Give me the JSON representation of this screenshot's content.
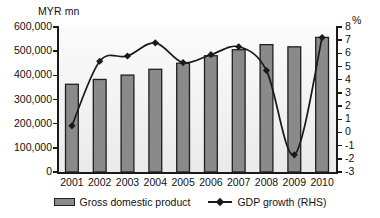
{
  "chart_data": {
    "type": "bar",
    "title": "",
    "xlabel": "",
    "ylabel": "MYR mn",
    "y2label": "%",
    "categories": [
      "2001",
      "2002",
      "2003",
      "2004",
      "2005",
      "2006",
      "2007",
      "2008",
      "2009",
      "2010"
    ],
    "ylim": [
      0,
      600000
    ],
    "y2lim": [
      -3,
      8
    ],
    "yticks": [
      0,
      100000,
      200000,
      300000,
      400000,
      500000,
      600000
    ],
    "ytick_labels": [
      "0",
      "100,000",
      "200,000",
      "300,000",
      "400,000",
      "500,000",
      "600,000"
    ],
    "y2ticks": [
      -3,
      -2,
      -1,
      0,
      1,
      2,
      3,
      4,
      5,
      6,
      7,
      8
    ],
    "y2tick_labels": [
      "-3",
      "-2",
      "-1",
      "0",
      "1",
      "2",
      "3",
      "4",
      "5",
      "6",
      "7",
      "8"
    ],
    "grid": false,
    "legend_position": "bottom",
    "series": [
      {
        "name": "Gross domestic product",
        "type": "bar",
        "axis": "left",
        "unit": "MYR mn",
        "color": "#8a8a8a",
        "edge_color": "#1f1f1f",
        "values": [
          363000,
          383000,
          401000,
          425000,
          450000,
          481000,
          506000,
          527000,
          518000,
          557000
        ]
      },
      {
        "name": "GDP growth (RHS)",
        "type": "line",
        "axis": "right",
        "unit": "%",
        "color": "#1a1a1a",
        "marker": "diamond",
        "values": [
          0.5,
          5.4,
          5.8,
          6.8,
          5.3,
          5.9,
          6.5,
          4.7,
          -1.7,
          7.2
        ]
      }
    ]
  },
  "axes": {
    "left_unit": "MYR mn",
    "right_unit": "%"
  },
  "legend": {
    "items": [
      {
        "label": "Gross domestic product",
        "marker": "bar-swatch"
      },
      {
        "label": "GDP growth (RHS)",
        "marker": "line-diamond-marker"
      }
    ]
  }
}
